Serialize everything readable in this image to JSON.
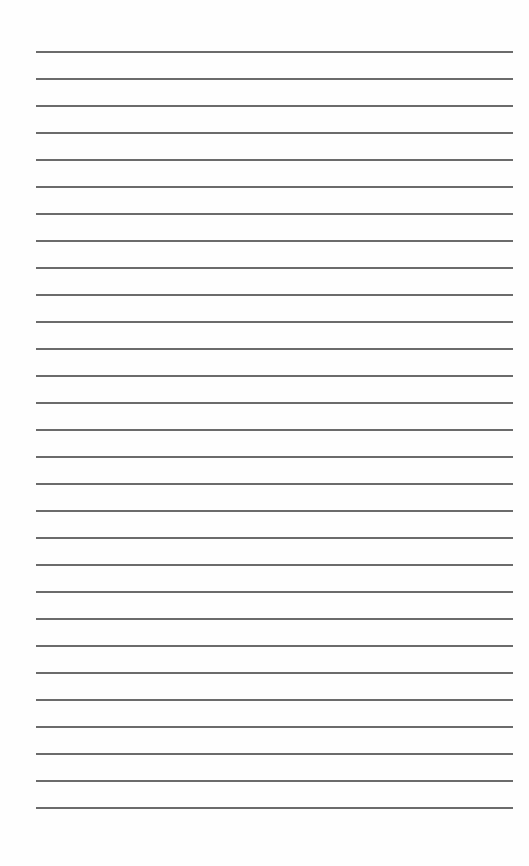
{
  "document": {
    "type": "lined-paper",
    "background_color": "#fefefe",
    "line_color": "#6b6b6b",
    "line_count": 29,
    "first_line_y": 52,
    "line_spacing_px": 27,
    "line_left_x": 36,
    "line_right_x": 513,
    "lines": [
      {
        "text": ""
      },
      {
        "text": ""
      },
      {
        "text": ""
      },
      {
        "text": ""
      },
      {
        "text": ""
      },
      {
        "text": ""
      },
      {
        "text": ""
      },
      {
        "text": ""
      },
      {
        "text": ""
      },
      {
        "text": ""
      },
      {
        "text": ""
      },
      {
        "text": ""
      },
      {
        "text": ""
      },
      {
        "text": ""
      },
      {
        "text": ""
      },
      {
        "text": ""
      },
      {
        "text": ""
      },
      {
        "text": ""
      },
      {
        "text": ""
      },
      {
        "text": ""
      },
      {
        "text": ""
      },
      {
        "text": ""
      },
      {
        "text": ""
      },
      {
        "text": ""
      },
      {
        "text": ""
      },
      {
        "text": ""
      },
      {
        "text": ""
      },
      {
        "text": ""
      },
      {
        "text": ""
      }
    ]
  }
}
